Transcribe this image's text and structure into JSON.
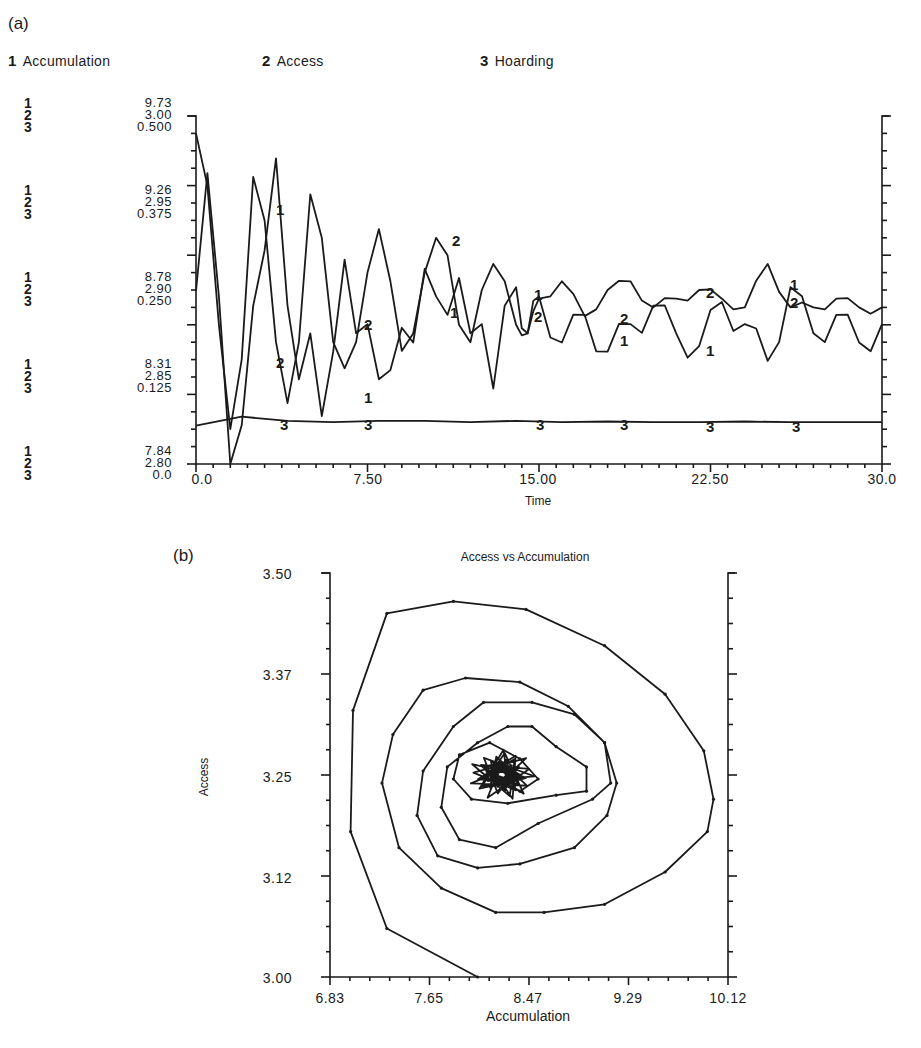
{
  "panels": {
    "a_label": "(a)",
    "b_label": "(b)"
  },
  "legend": [
    {
      "num": "1",
      "label": "Accumulation"
    },
    {
      "num": "2",
      "label": "Access"
    },
    {
      "num": "3",
      "label": "Hoarding"
    }
  ],
  "top_chart": {
    "y_scales": [
      {
        "s1": "9.73",
        "s2": "3.00",
        "s3": "0.500"
      },
      {
        "s1": "9.26",
        "s2": "2.95",
        "s3": "0.375"
      },
      {
        "s1": "8.78",
        "s2": "2.90",
        "s3": "0.250"
      },
      {
        "s1": "8.31",
        "s2": "2.85",
        "s3": "0.125"
      },
      {
        "s1": "7.84",
        "s2": "2.80",
        "s3": "0.0"
      }
    ],
    "x_ticks": [
      "0.0",
      "7.50",
      "15.00",
      "22.50",
      "30.0"
    ],
    "xlabel": "Time"
  },
  "bottom_chart": {
    "title": "Access vs Accumulation",
    "ylabel": "Access",
    "xlabel": "Accumulation",
    "y_ticks": [
      "3.50",
      "3.37",
      "3.25",
      "3.12",
      "3.00"
    ],
    "x_ticks": [
      "6.83",
      "7.65",
      "8.47",
      "9.29",
      "10.12"
    ]
  },
  "chart_data": [
    {
      "type": "line",
      "title": "",
      "xlabel": "Time",
      "ylabel": "",
      "xlim": [
        0,
        30
      ],
      "x_ticks": [
        0,
        7.5,
        15,
        22.5,
        30
      ],
      "grid": false,
      "legend_position": "top",
      "series": [
        {
          "name": "1 Accumulation",
          "ylim": [
            7.84,
            9.73
          ],
          "x": [
            0,
            0.5,
            1,
            1.5,
            2,
            2.5,
            3,
            3.5,
            4,
            4.5,
            5,
            5.5,
            6,
            6.5,
            7,
            7.5,
            8,
            8.5,
            9,
            9.5,
            10,
            10.5,
            11,
            11.5,
            12,
            12.5,
            13,
            13.5,
            14,
            14.5,
            15,
            16,
            17,
            18,
            19,
            20,
            21,
            22,
            23,
            24,
            25,
            26,
            27,
            28,
            29,
            30
          ],
          "values": [
            8.78,
            9.42,
            8.75,
            7.84,
            8.05,
            8.7,
            9.0,
            9.5,
            8.7,
            8.3,
            8.55,
            8.1,
            8.45,
            8.95,
            8.55,
            8.6,
            8.3,
            8.35,
            8.58,
            8.5,
            8.9,
            8.75,
            8.65,
            8.85,
            8.55,
            8.6,
            8.25,
            8.7,
            8.8,
            8.55,
            8.75,
            8.5,
            8.65,
            8.45,
            8.6,
            8.7,
            8.55,
            8.48,
            8.72,
            8.6,
            8.4,
            8.8,
            8.55,
            8.65,
            8.5,
            8.6
          ]
        },
        {
          "name": "2 Access",
          "ylim": [
            2.8,
            3.0
          ],
          "x": [
            0,
            0.5,
            1,
            1.5,
            2,
            2.5,
            3,
            3.5,
            4,
            4.5,
            5,
            5.5,
            6,
            6.5,
            7,
            7.5,
            8,
            8.5,
            9,
            9.5,
            10,
            10.5,
            11,
            11.5,
            12,
            12.5,
            13,
            13.5,
            14,
            14.5,
            15,
            16,
            17,
            18,
            19,
            20,
            21,
            22,
            23,
            24,
            25,
            26,
            27,
            28,
            29,
            30
          ],
          "values": [
            2.99,
            2.96,
            2.88,
            2.82,
            2.86,
            2.965,
            2.94,
            2.87,
            2.835,
            2.87,
            2.955,
            2.93,
            2.87,
            2.855,
            2.87,
            2.91,
            2.935,
            2.905,
            2.865,
            2.875,
            2.91,
            2.93,
            2.92,
            2.88,
            2.87,
            2.9,
            2.915,
            2.905,
            2.88,
            2.875,
            2.895,
            2.905,
            2.885,
            2.9,
            2.905,
            2.89,
            2.895,
            2.9,
            2.895,
            2.89,
            2.915,
            2.89,
            2.89,
            2.895,
            2.89,
            2.89
          ]
        },
        {
          "name": "3 Hoarding",
          "ylim": [
            0.0,
            0.5
          ],
          "x": [
            0,
            2,
            4,
            6,
            8,
            10,
            12,
            14,
            16,
            18,
            20,
            22,
            24,
            26,
            28,
            30
          ],
          "values": [
            0.055,
            0.068,
            0.062,
            0.06,
            0.062,
            0.062,
            0.06,
            0.062,
            0.06,
            0.061,
            0.06,
            0.06,
            0.061,
            0.06,
            0.06,
            0.06
          ]
        }
      ]
    },
    {
      "type": "line",
      "title": "Access vs Accumulation",
      "xlabel": "Accumulation",
      "ylabel": "Access",
      "xlim": [
        6.83,
        10.12
      ],
      "ylim": [
        3.0,
        3.5
      ],
      "x_ticks": [
        6.83,
        7.65,
        8.47,
        9.29,
        10.12
      ],
      "y_ticks": [
        3.0,
        3.12,
        3.25,
        3.37,
        3.5
      ],
      "grid": false,
      "series": [
        {
          "name": "Access vs Accumulation (phase spiral)",
          "x": [
            8.05,
            7.3,
            7.0,
            7.02,
            7.3,
            7.85,
            8.45,
            9.1,
            9.6,
            9.92,
            10.0,
            9.95,
            9.6,
            9.1,
            8.6,
            8.2,
            7.75,
            7.4,
            7.26,
            7.35,
            7.6,
            7.95,
            8.4,
            8.8,
            9.1,
            9.2,
            9.12,
            8.85,
            8.4,
            8.05,
            7.72,
            7.55,
            7.6,
            7.85,
            8.1,
            8.5,
            8.85,
            9.1,
            9.15,
            9.0,
            8.55,
            8.2,
            7.9,
            7.75,
            7.8,
            8.05,
            8.3,
            8.5,
            8.7,
            8.95,
            8.95,
            8.7,
            8.3,
            8.0,
            7.85,
            7.9,
            8.15,
            8.4,
            8.55,
            8.4,
            8.2,
            8.1,
            8.25,
            8.4,
            8.3,
            8.2
          ],
          "y": [
            3.0,
            3.06,
            3.18,
            3.33,
            3.45,
            3.465,
            3.455,
            3.41,
            3.35,
            3.28,
            3.22,
            3.18,
            3.13,
            3.09,
            3.08,
            3.08,
            3.11,
            3.16,
            3.24,
            3.3,
            3.355,
            3.37,
            3.365,
            3.335,
            3.29,
            3.24,
            3.2,
            3.16,
            3.14,
            3.135,
            3.15,
            3.2,
            3.255,
            3.31,
            3.34,
            3.34,
            3.325,
            3.29,
            3.24,
            3.22,
            3.19,
            3.16,
            3.17,
            3.21,
            3.26,
            3.29,
            3.31,
            3.31,
            3.285,
            3.26,
            3.23,
            3.225,
            3.215,
            3.22,
            3.245,
            3.275,
            3.29,
            3.27,
            3.245,
            3.23,
            3.245,
            3.26,
            3.265,
            3.25,
            3.245,
            3.25
          ]
        }
      ]
    }
  ]
}
